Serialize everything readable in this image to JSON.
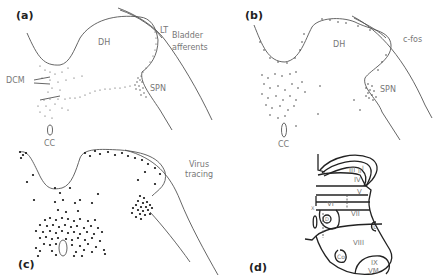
{
  "figure": {
    "panels": [
      {
        "id": "a",
        "label": "(a)",
        "title": "Bladder afferents",
        "title_lines": [
          "Bladder",
          "afferents"
        ],
        "regions": {
          "dh": "DH",
          "lt": "LT",
          "spn": "SPN",
          "dcm": "DCM",
          "cc": "CC"
        }
      },
      {
        "id": "b",
        "label": "(b)",
        "title": "c-fos",
        "regions": {
          "dh": "DH",
          "spn": "SPN",
          "cc": "CC"
        }
      },
      {
        "id": "c",
        "label": "(c)",
        "title": "Virus tracing",
        "title_lines": [
          "Virus",
          "tracing"
        ]
      },
      {
        "id": "d",
        "label": "(d)",
        "laminae": {
          "I": "I",
          "II": "II",
          "III": "III",
          "IV": "IV",
          "V": "V",
          "VI": "VI",
          "VII": "VII",
          "VIII": "VIII",
          "IX": "IX",
          "X": "X",
          "VM": "VM",
          "Co": "Co",
          "IL": "IL",
          "D": "D"
        }
      }
    ],
    "colors": {
      "line": "#555555",
      "dot": "#444444",
      "text": "#777777"
    }
  }
}
